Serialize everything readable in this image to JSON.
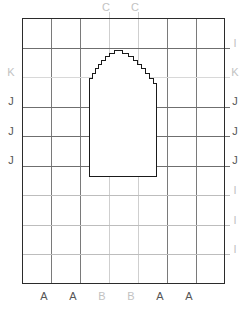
{
  "diagram": {
    "type": "stepped-arch-over-alignment-grid",
    "colors": {
      "border": "#2b2b2b",
      "gridline_dark": "#7a7a7a",
      "gridline_light": "#cfcfcf",
      "shape_stroke": "#1a1a1a",
      "shape_fill": "#ffffff",
      "label_dark": "#555555",
      "label_light": "#c2c2c2",
      "background": "#ffffff"
    },
    "grid": {
      "columns": 7,
      "rows": 9,
      "left": 22,
      "top": 18,
      "right": 224,
      "bottom": 283,
      "column_x": [
        22,
        51,
        80,
        109,
        138,
        167,
        196,
        224
      ],
      "row_y": [
        18,
        48,
        77,
        107,
        136,
        166,
        195,
        225,
        254,
        283
      ]
    },
    "labels": {
      "top": [
        {
          "text": "C",
          "x": 106,
          "y": 2,
          "tone": "light"
        },
        {
          "text": "C",
          "x": 135,
          "y": 2,
          "tone": "light"
        }
      ],
      "left": [
        {
          "text": "K",
          "x": 8,
          "y": 72,
          "tone": "light"
        },
        {
          "text": "J",
          "x": 8,
          "y": 101,
          "tone": "dark"
        },
        {
          "text": "J",
          "x": 8,
          "y": 131,
          "tone": "dark"
        },
        {
          "text": "J",
          "x": 8,
          "y": 160,
          "tone": "dark"
        }
      ],
      "right": [
        {
          "text": "I",
          "x": 231,
          "y": 43,
          "tone": "light"
        },
        {
          "text": "K",
          "x": 231,
          "y": 72,
          "tone": "light"
        },
        {
          "text": "J",
          "x": 231,
          "y": 101,
          "tone": "dark"
        },
        {
          "text": "J",
          "x": 231,
          "y": 131,
          "tone": "dark"
        },
        {
          "text": "J",
          "x": 231,
          "y": 160,
          "tone": "dark"
        },
        {
          "text": "I",
          "x": 231,
          "y": 190,
          "tone": "light"
        },
        {
          "text": "I",
          "x": 231,
          "y": 220,
          "tone": "light"
        },
        {
          "text": "I",
          "x": 231,
          "y": 249,
          "tone": "light"
        }
      ],
      "bottom": [
        {
          "text": "A",
          "x": 44,
          "y": 291,
          "tone": "dark"
        },
        {
          "text": "A",
          "x": 73,
          "y": 291,
          "tone": "dark"
        },
        {
          "text": "B",
          "x": 102,
          "y": 291,
          "tone": "light"
        },
        {
          "text": "B",
          "x": 131,
          "y": 291,
          "tone": "light"
        },
        {
          "text": "A",
          "x": 160,
          "y": 291,
          "tone": "dark"
        },
        {
          "text": "A",
          "x": 189,
          "y": 291,
          "tone": "dark"
        }
      ]
    },
    "gridlines": {
      "vertical": [
        {
          "x": 51,
          "tone": "dark"
        },
        {
          "x": 80,
          "tone": "dark"
        },
        {
          "x": 109,
          "tone": "light"
        },
        {
          "x": 138,
          "tone": "light"
        },
        {
          "x": 167,
          "tone": "dark"
        },
        {
          "x": 196,
          "tone": "dark"
        }
      ],
      "horizontal": [
        {
          "y": 48,
          "tone": "dark"
        },
        {
          "y": 77,
          "tone": "light"
        },
        {
          "y": 107,
          "tone": "dark"
        },
        {
          "y": 136,
          "tone": "dark"
        },
        {
          "y": 166,
          "tone": "dark"
        },
        {
          "y": 195,
          "tone": "light"
        },
        {
          "y": 225,
          "tone": "light"
        },
        {
          "y": 254,
          "tone": "light"
        }
      ]
    },
    "shape": {
      "name": "stepped-arch",
      "left": 89,
      "right": 156,
      "baseline": 176,
      "apex": 50,
      "path": "M 89.5 176.5 L 89.5 78.5 L 92.5 78.5 L 92.5 73.5 L 95.5 73.5 L 95.5 68.5 L 98.5 68.5 L 98.5 64.5 L 101.5 64.5 L 101.5 60.5 L 105.5 60.5 L 105.5 56.5 L 109.5 56.5 L 109.5 53.5 L 114.5 53.5 L 114.5 50.5 L 122.5 50.5 L 122.5 53.5 L 128.5 53.5 L 128.5 56.5 L 133.5 56.5 L 133.5 60.5 L 137.5 60.5 L 137.5 64.5 L 141.5 64.5 L 141.5 68.5 L 145.5 68.5 L 145.5 73.5 L 149.5 73.5 L 149.5 78.5 L 153.5 78.5 L 153.5 83.5 L 156.5 83.5 L 156.5 176.5 Z"
    }
  }
}
